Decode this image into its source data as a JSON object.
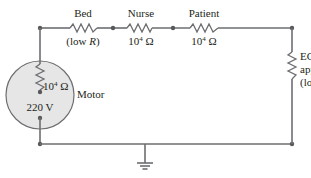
{
  "diagram": {
    "type": "circuit",
    "colors": {
      "wire": "#6d6e71",
      "motor_fill": "#e6e6e6",
      "text": "#231f20"
    },
    "components": [
      {
        "id": "bed",
        "name": "Bed",
        "value": "(low R)",
        "value_prefix": "(low ",
        "value_italic": "R",
        "value_suffix": ")"
      },
      {
        "id": "nurse",
        "name": "Nurse",
        "value": "10^4 Ω",
        "base": "10",
        "exp": "4",
        "unit": " Ω"
      },
      {
        "id": "patient",
        "name": "Patient",
        "value": "10^4 Ω",
        "base": "10",
        "exp": "4",
        "unit": " Ω"
      },
      {
        "id": "ecg",
        "name_line1": "ECG",
        "name_line2": "apparatus",
        "value": "(low R)",
        "value_prefix": "(low ",
        "value_italic": "R",
        "value_suffix": ")"
      },
      {
        "id": "motor",
        "name": "Motor",
        "internal_resistance": "10^4 Ω",
        "base": "10",
        "exp": "4",
        "unit": " Ω",
        "voltage": "220 V"
      }
    ],
    "ground": {
      "symbol": "ground"
    }
  }
}
